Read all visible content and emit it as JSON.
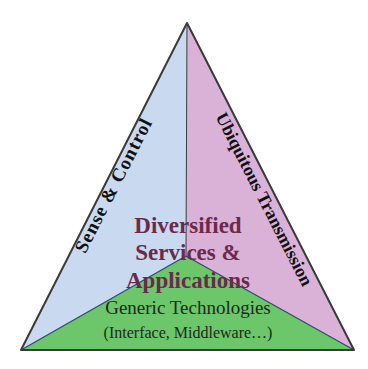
{
  "diagram": {
    "type": "triangle-framework",
    "colors": {
      "sense_region": "#c9d9ef",
      "transmission_region": "#dbb2d7",
      "generic_region": "#6cc76a",
      "outline": "#3a3a3a",
      "inner_line": "#2d4a6b",
      "center_text": "#6b2a4c",
      "side_text": "#111111"
    },
    "regions": {
      "left": {
        "label": "Sense & Control",
        "label_parts": [
          "Sense",
          "&",
          "Control"
        ]
      },
      "right": {
        "label": "Ubiquitous Transmission"
      },
      "bottom": {
        "label_line1": "Generic Technologies",
        "label_line2": "(Interface, Middleware…)"
      }
    },
    "center": {
      "line1": "Diversified",
      "line2": "Services &",
      "line3": "Applications"
    }
  }
}
